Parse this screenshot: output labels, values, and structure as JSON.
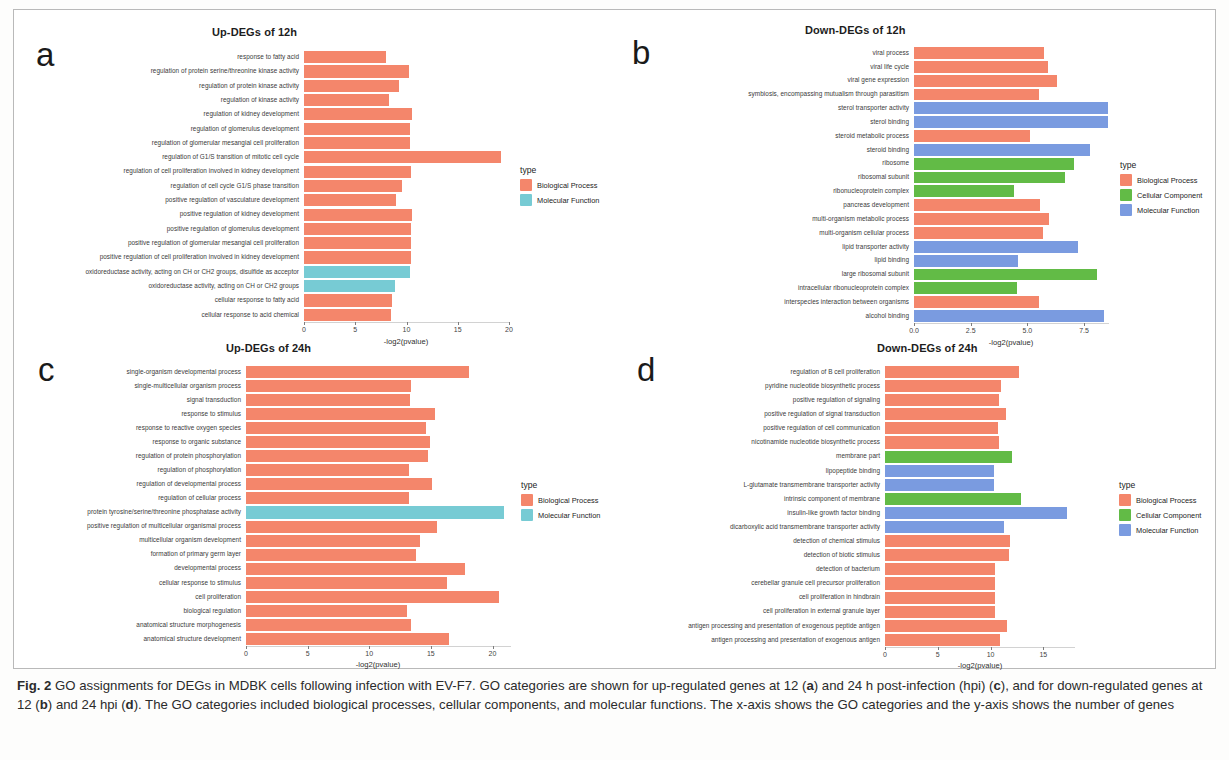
{
  "figure": {
    "caption_label": "Fig. 2",
    "caption_text": " GO assignments for DEGs in MDBK cells following infection with EV-F7. GO categories are shown for up-regulated genes at 12 (a) and 24 h post-infection (hpi) (c), and for down-regulated genes at 12 (b) and 24 hpi (d). The GO categories included biological processes, cellular components, and molecular functions. The x-axis shows the GO categories and the y-axis shows the number of genes"
  },
  "colors": {
    "biological_process": "#F4866B",
    "cellular_component": "#62BB46",
    "molecular_function": "#7A9BE0",
    "molecular_function_teal": "#77CBD4"
  },
  "legends": {
    "two_type": {
      "title": "type",
      "items": [
        {
          "label": "Biological Process",
          "color": "#F4866B"
        },
        {
          "label": "Molecular Function",
          "color": "#77CBD4"
        }
      ]
    },
    "three_type": {
      "title": "type",
      "items": [
        {
          "label": "Biological Process",
          "color": "#F4866B"
        },
        {
          "label": "Cellular Component",
          "color": "#62BB46"
        },
        {
          "label": "Molecular Function",
          "color": "#7A9BE0"
        }
      ]
    }
  },
  "chart_data": [
    {
      "panel": "a",
      "type": "bar",
      "orientation": "horizontal",
      "title": "Up-DEGs of 12h",
      "xlabel": "-log2(pvalue)",
      "ylabel": "",
      "xlim": [
        0,
        20
      ],
      "xticks": [
        0,
        5,
        10,
        15,
        20
      ],
      "xticklabels": [
        "0",
        "5",
        "10",
        "15",
        "20"
      ],
      "grid": false,
      "legend": "two_type",
      "legend_position": "right",
      "categories": [
        "response to fatty acid",
        "regulation of protein serine/threonine kinase activity",
        "regulation of protein kinase activity",
        "regulation of kinase activity",
        "regulation of kidney development",
        "regulation of glomerulus development",
        "regulation of glomerular mesangial cell proliferation",
        "regulation of G1/S transition of mitotic cell cycle",
        "regulation of cell proliferation involved in kidney development",
        "regulation of cell cycle G1/S phase transition",
        "positive regulation of vasculature development",
        "positive regulation of kidney development",
        "positive regulation of glomerulus development",
        "positive regulation of glomerular mesangial cell proliferation",
        "positive regulation of cell proliferation involved in kidney development",
        "oxidoreductase activity, acting on CH or CH2 groups, disulfide as acceptor",
        "oxidoreductase activity, acting on CH or CH2 groups",
        "cellular response to fatty acid",
        "cellular response to acid chemical"
      ],
      "values": [
        8.0,
        10.2,
        9.3,
        8.3,
        10.5,
        10.3,
        10.3,
        19.2,
        10.4,
        9.6,
        9.0,
        10.5,
        10.4,
        10.4,
        10.4,
        10.3,
        8.9,
        8.6,
        8.5
      ],
      "types": [
        "Biological Process",
        "Biological Process",
        "Biological Process",
        "Biological Process",
        "Biological Process",
        "Biological Process",
        "Biological Process",
        "Biological Process",
        "Biological Process",
        "Biological Process",
        "Biological Process",
        "Biological Process",
        "Biological Process",
        "Biological Process",
        "Biological Process",
        "Molecular Function",
        "Molecular Function",
        "Biological Process",
        "Biological Process"
      ]
    },
    {
      "panel": "b",
      "type": "bar",
      "orientation": "horizontal",
      "title": "Down-DEGs of 12h",
      "xlabel": "-log2(pvalue)",
      "ylabel": "",
      "xlim": [
        0,
        8.6
      ],
      "xticks": [
        0,
        2.5,
        5.0,
        7.5
      ],
      "xticklabels": [
        "0.0",
        "2.5",
        "5.0",
        "7.5"
      ],
      "grid": false,
      "legend": "three_type",
      "legend_position": "right",
      "categories": [
        "viral process",
        "viral life cycle",
        "viral gene expression",
        "symbiosis, encompassing mutualism through parasitism",
        "sterol transporter activity",
        "sterol binding",
        "steroid metabolic process",
        "steroid binding",
        "ribosome",
        "ribosomal subunit",
        "ribonucleoprotein complex",
        "pancreas development",
        "multi-organism metabolic process",
        "multi-organism cellular process",
        "lipid transporter activity",
        "lipid binding",
        "large ribosomal subunit",
        "intracellular ribonucleoprotein complex",
        "interspecies interaction between organisms",
        "alcohol binding"
      ],
      "values": [
        5.75,
        5.9,
        6.3,
        5.5,
        8.55,
        8.55,
        5.1,
        7.75,
        7.05,
        6.65,
        4.4,
        5.55,
        5.95,
        5.7,
        7.25,
        4.6,
        8.05,
        4.55,
        5.5,
        8.4
      ],
      "types": [
        "Biological Process",
        "Biological Process",
        "Biological Process",
        "Biological Process",
        "Molecular Function",
        "Molecular Function",
        "Biological Process",
        "Molecular Function",
        "Cellular Component",
        "Cellular Component",
        "Cellular Component",
        "Biological Process",
        "Biological Process",
        "Biological Process",
        "Molecular Function",
        "Molecular Function",
        "Cellular Component",
        "Cellular Component",
        "Biological Process",
        "Molecular Function"
      ]
    },
    {
      "panel": "c",
      "type": "bar",
      "orientation": "horizontal",
      "title": "Up-DEGs of 24h",
      "xlabel": "-log2(pvalue)",
      "ylabel": "",
      "xlim": [
        0,
        21.5
      ],
      "xticks": [
        0,
        5,
        10,
        15,
        20
      ],
      "xticklabels": [
        "0",
        "5",
        "10",
        "15",
        "20"
      ],
      "grid": false,
      "legend": "two_type",
      "legend_position": "right",
      "categories": [
        "single-organism developmental process",
        "single-multicellular organism process",
        "signal transduction",
        "response to stimulus",
        "response to reactive oxygen species",
        "response to organic substance",
        "regulation of protein phosphorylation",
        "regulation of phosphorylation",
        "regulation of developmental process",
        "regulation of cellular process",
        "protein tyrosine/serine/threonine phosphatase activity",
        "positive regulation of multicellular organismal process",
        "multicellular organism development",
        "formation of primary germ layer",
        "developmental process",
        "cellular response to stimulus",
        "cell proliferation",
        "biological regulation",
        "anatomical structure morphogenesis",
        "anatomical structure development"
      ],
      "values": [
        18.1,
        13.4,
        13.3,
        15.3,
        14.6,
        14.9,
        14.8,
        13.2,
        15.1,
        13.2,
        20.9,
        15.5,
        14.1,
        13.8,
        17.8,
        16.3,
        20.5,
        13.1,
        13.4,
        16.5
      ],
      "types": [
        "Biological Process",
        "Biological Process",
        "Biological Process",
        "Biological Process",
        "Biological Process",
        "Biological Process",
        "Biological Process",
        "Biological Process",
        "Biological Process",
        "Biological Process",
        "Molecular Function",
        "Biological Process",
        "Biological Process",
        "Biological Process",
        "Biological Process",
        "Biological Process",
        "Biological Process",
        "Biological Process",
        "Biological Process",
        "Biological Process"
      ]
    },
    {
      "panel": "d",
      "type": "bar",
      "orientation": "horizontal",
      "title": "Down-DEGs of 24h",
      "xlabel": "-log2(pvalue)",
      "ylabel": "",
      "xlim": [
        0,
        18
      ],
      "xticks": [
        0,
        5,
        10,
        15
      ],
      "xticklabels": [
        "0",
        "5",
        "10",
        "15"
      ],
      "grid": false,
      "legend": "three_type",
      "legend_position": "right",
      "categories": [
        "regulation of B cell proliferation",
        "pyridine nucleotide biosynthetic process",
        "positive regulation of signaling",
        "positive regulation of signal transduction",
        "positive regulation of cell communication",
        "nicotinamide nucleotide biosynthetic process",
        "membrane part",
        "lipopeptide binding",
        "L-glutamate transmembrane transporter activity",
        "intrinsic component of membrane",
        "insulin-like growth factor binding",
        "dicarboxylic acid transmembrane transporter activity",
        "detection of chemical stimulus",
        "detection of biotic stimulus",
        "detection of bacterium",
        "cerebellar granule cell precursor proliferation",
        "cell proliferation in hindbrain",
        "cell proliferation in external granule layer",
        "antigen processing and presentation of exogenous peptide antigen",
        "antigen processing and presentation of exogenous antigen"
      ],
      "values": [
        12.7,
        11.0,
        10.8,
        11.5,
        10.7,
        10.8,
        12.0,
        10.3,
        10.3,
        12.9,
        17.2,
        11.3,
        11.8,
        11.7,
        10.4,
        10.4,
        10.4,
        10.4,
        11.6,
        10.9
      ],
      "types": [
        "Biological Process",
        "Biological Process",
        "Biological Process",
        "Biological Process",
        "Biological Process",
        "Biological Process",
        "Cellular Component",
        "Molecular Function",
        "Molecular Function",
        "Cellular Component",
        "Molecular Function",
        "Molecular Function",
        "Biological Process",
        "Biological Process",
        "Biological Process",
        "Biological Process",
        "Biological Process",
        "Biological Process",
        "Biological Process",
        "Biological Process"
      ]
    }
  ]
}
